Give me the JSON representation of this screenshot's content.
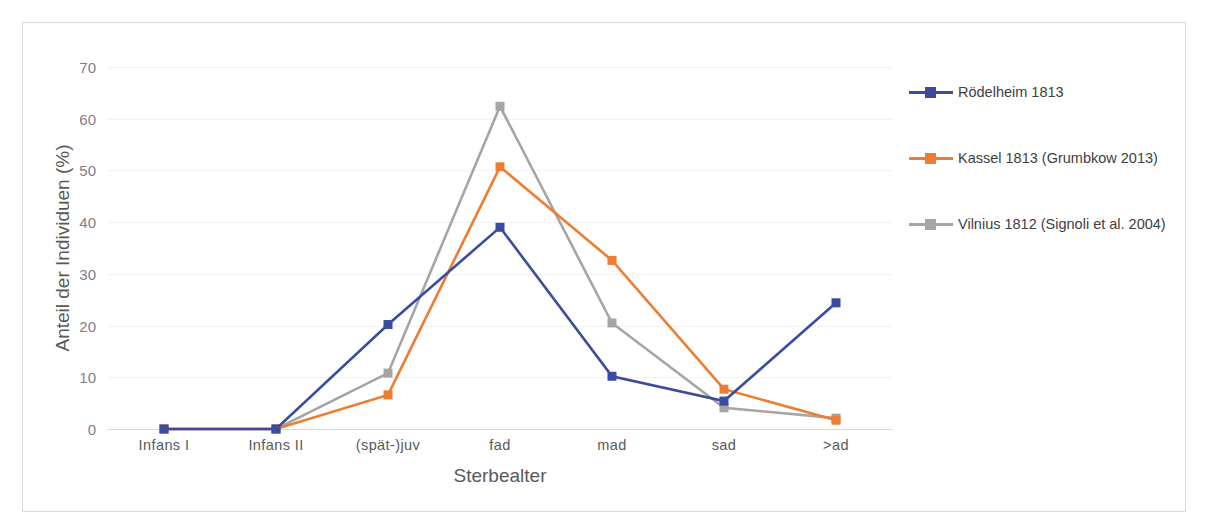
{
  "chart_data": {
    "type": "line",
    "title": "",
    "xlabel": "Sterbealter",
    "ylabel": "Anteil der Individuen (%)",
    "categories": [
      "Infans I",
      "Infans II",
      "(spät-)juv",
      "fad",
      "mad",
      "sad",
      ">ad"
    ],
    "ylim": [
      0,
      70
    ],
    "yticks": [
      0,
      10,
      20,
      30,
      40,
      50,
      60,
      70
    ],
    "grid": true,
    "legend_position": "right",
    "series": [
      {
        "name": "Rödelheim 1813",
        "color": "#3B4CA0",
        "marker": "square",
        "values": [
          0,
          0,
          20.2,
          39.0,
          10.2,
          5.4,
          24.4
        ]
      },
      {
        "name": "Kassel 1813 (Grumbkow 2013)",
        "color": "#ED7D31",
        "marker": "square",
        "values": [
          0,
          0,
          6.6,
          50.7,
          32.6,
          7.7,
          1.7
        ]
      },
      {
        "name": "Vilnius 1812 (Signoli et al. 2004)",
        "color": "#A5A5A5",
        "marker": "square",
        "values": [
          0,
          0,
          10.8,
          62.4,
          20.5,
          4.1,
          2.1
        ]
      }
    ]
  },
  "style": {
    "frame_border": "#d9d9d9",
    "gridline_color": "#f2f2f2",
    "axis_color": "#d9d9d9",
    "tick_text_color": "#7f7f7f",
    "axis_title_color": "#595959",
    "legend_text_color": "#404040",
    "background": "#ffffff"
  }
}
